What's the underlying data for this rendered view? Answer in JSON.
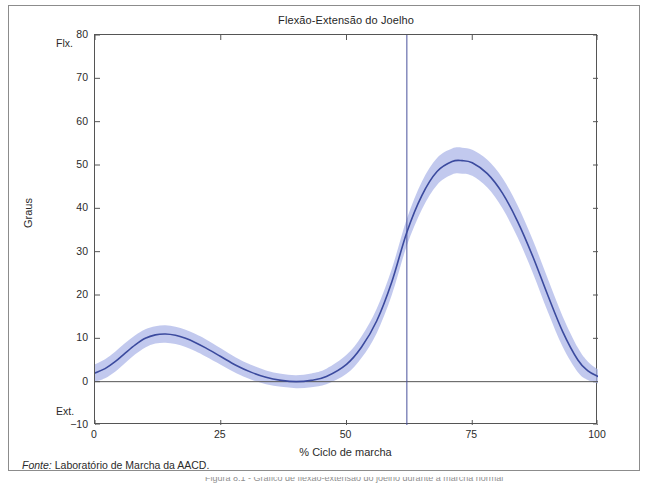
{
  "figure": {
    "title": "Flexão-Extensão do Joelho",
    "source_key": "Fonte:",
    "source_value": " Laboratório de Marcha da AACD.",
    "caption_cut": "Figura 8.1 - Gráfico de flexão-extensão do joelho durante a marcha normal"
  },
  "colors": {
    "line": "#3b4a9e",
    "band": "#aab4e8",
    "axis": "#555555",
    "frame": "#8c8c8c",
    "zero_line": "#555555",
    "event_line": "#49519b",
    "background": "#ffffff"
  },
  "chart_data": {
    "type": "line",
    "title": "Flexão-Extensão do Joelho",
    "xlabel": "% Ciclo de marcha",
    "ylabel": "Graus",
    "xlim": [
      0,
      100
    ],
    "ylim": [
      -10,
      80
    ],
    "xticks": [
      0,
      25,
      50,
      75,
      100
    ],
    "yticks": [
      -10,
      0,
      10,
      20,
      30,
      40,
      50,
      60,
      70,
      80
    ],
    "grid": false,
    "legend": null,
    "axis_end_labels": {
      "y_top": "Flx.",
      "y_bottom": "Ext."
    },
    "annotations": [
      {
        "name": "toe-off-line",
        "type": "vline",
        "x": 62,
        "label": ""
      },
      {
        "name": "zero-line",
        "type": "hline",
        "y": 0,
        "label": ""
      }
    ],
    "series": [
      {
        "name": "Flexão-extensão do joelho (média)",
        "color": "#3b4a9e",
        "x": [
          0,
          2,
          4,
          6,
          8,
          10,
          12,
          14,
          16,
          18,
          20,
          22,
          25,
          28,
          31,
          34,
          37,
          40,
          43,
          46,
          50,
          53,
          56,
          59,
          62,
          65,
          68,
          71,
          73,
          75,
          78,
          81,
          84,
          87,
          90,
          93,
          96,
          98,
          100
        ],
        "y": [
          2.0,
          3.0,
          4.6,
          6.6,
          8.5,
          10.0,
          10.8,
          11.0,
          10.7,
          10.0,
          9.0,
          7.8,
          5.8,
          3.8,
          2.2,
          1.0,
          0.3,
          0.0,
          0.3,
          1.2,
          4.0,
          8.0,
          14.0,
          23.0,
          34.5,
          43.0,
          48.5,
          50.8,
          51.0,
          50.5,
          48.0,
          43.5,
          37.0,
          29.0,
          20.0,
          11.5,
          5.0,
          2.5,
          1.2
        ]
      },
      {
        "name": "Banda +1 desvio padrão",
        "color": "#aab4e8",
        "x": [
          0,
          2,
          4,
          6,
          8,
          10,
          12,
          14,
          16,
          18,
          20,
          22,
          25,
          28,
          31,
          34,
          37,
          40,
          43,
          46,
          50,
          53,
          56,
          59,
          62,
          65,
          68,
          71,
          73,
          75,
          78,
          81,
          84,
          87,
          90,
          93,
          96,
          98,
          100
        ],
        "y": [
          4.0,
          5.2,
          6.9,
          8.9,
          10.7,
          12.1,
          12.8,
          13.0,
          12.7,
          12.0,
          11.0,
          9.8,
          7.7,
          5.6,
          3.9,
          2.6,
          1.8,
          1.5,
          1.9,
          3.0,
          6.2,
          10.5,
          16.8,
          26.0,
          37.6,
          46.2,
          51.6,
          53.8,
          54.0,
          53.5,
          51.2,
          47.0,
          40.7,
          32.8,
          23.8,
          15.0,
          7.8,
          4.6,
          2.8
        ]
      },
      {
        "name": "Banda -1 desvio padrão",
        "color": "#aab4e8",
        "x": [
          0,
          2,
          4,
          6,
          8,
          10,
          12,
          14,
          16,
          18,
          20,
          22,
          25,
          28,
          31,
          34,
          37,
          40,
          43,
          46,
          50,
          53,
          56,
          59,
          62,
          65,
          68,
          71,
          73,
          75,
          78,
          81,
          84,
          87,
          90,
          93,
          96,
          98,
          100
        ],
        "y": [
          0.0,
          0.8,
          2.3,
          4.3,
          6.3,
          7.9,
          8.8,
          9.0,
          8.7,
          8.0,
          7.0,
          5.8,
          3.9,
          2.0,
          0.5,
          -0.6,
          -1.2,
          -1.5,
          -1.3,
          -0.6,
          1.8,
          5.5,
          11.2,
          20.0,
          31.4,
          39.8,
          45.4,
          47.8,
          48.0,
          47.5,
          44.8,
          40.0,
          33.3,
          25.2,
          16.2,
          8.0,
          2.2,
          0.4,
          -0.4
        ]
      }
    ]
  }
}
